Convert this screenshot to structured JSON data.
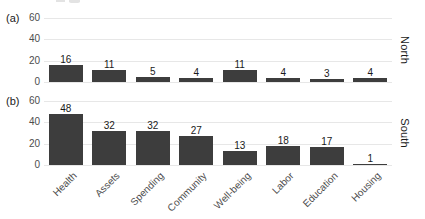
{
  "figure": {
    "background": "#ffffff",
    "grid_color": "#e7e7e7",
    "bar_color": "#3d3d3d",
    "tick_text_color": "#4d4d4d",
    "label_text_color": "#1a1a1a"
  },
  "chart_data": [
    {
      "type": "bar",
      "panel_tag": "(a)",
      "facet_label": "North",
      "categories": [
        "Health",
        "Assets",
        "Spending",
        "Community",
        "Well-being",
        "Labor",
        "Education",
        "Housing"
      ],
      "values": [
        16,
        11,
        5,
        4,
        11,
        4,
        3,
        4
      ],
      "value_labels_shown": true,
      "ylim": [
        0,
        60
      ],
      "yticks": [
        0,
        20,
        40,
        60
      ],
      "grid": "horizontal-major",
      "legend": "none",
      "xlabel": "",
      "ylabel": ""
    },
    {
      "type": "bar",
      "panel_tag": "(b)",
      "facet_label": "South",
      "categories": [
        "Health",
        "Assets",
        "Spending",
        "Community",
        "Well-being",
        "Labor",
        "Education",
        "Housing"
      ],
      "values": [
        48,
        32,
        32,
        27,
        13,
        18,
        17,
        1
      ],
      "value_labels_shown": true,
      "ylim": [
        0,
        60
      ],
      "yticks": [
        0,
        20,
        40,
        60
      ],
      "grid": "horizontal-major",
      "legend": "none",
      "xlabel": "",
      "ylabel": ""
    }
  ]
}
